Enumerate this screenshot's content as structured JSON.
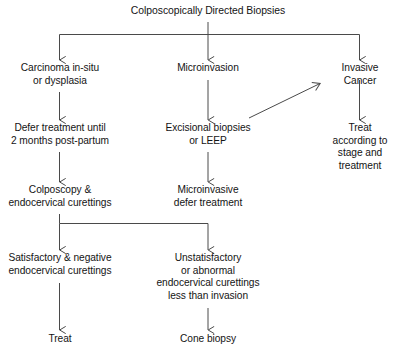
{
  "diagram": {
    "type": "flowchart",
    "title": "Colposcopically Directed Biopsies",
    "orientation": "top-down",
    "stroke_color": "#4a4a4a",
    "text_color": "#141414",
    "background_color": "#ffffff",
    "nodes": {
      "root": "Colposcopically Directed Biopsies",
      "branch_left_1": "Carcinoma in-situ\nor dysplasia",
      "branch_mid_1": "Microinvasion",
      "branch_right_1": "Invasive Cancer",
      "left_2": "Defer treatment until\n2 months post-partum",
      "mid_2": "Excisional biopsies\nor LEEP",
      "right_2": "Treat according to\nstage and treatment",
      "left_3": "Colposcopy &\nendocervical curettings",
      "mid_3": "Microinvasive\ndefer treatment",
      "left_4": "Satisfactory & negative\nendocervical curettings",
      "mid_4": "Unstatisfactory\nor abnormal\nendocervical curettings\nless than invasion",
      "left_5": "Treat",
      "mid_5": "Cone biopsy"
    },
    "edges": [
      {
        "from": "root",
        "to": "branch_left_1",
        "style": "elbow-arrow"
      },
      {
        "from": "root",
        "to": "branch_mid_1",
        "style": "straight-arrow"
      },
      {
        "from": "root",
        "to": "branch_right_1",
        "style": "elbow-arrow"
      },
      {
        "from": "branch_left_1",
        "to": "left_2",
        "style": "straight-arrow"
      },
      {
        "from": "branch_mid_1",
        "to": "mid_2",
        "style": "straight-arrow"
      },
      {
        "from": "branch_right_1",
        "to": "right_2",
        "style": "straight-arrow"
      },
      {
        "from": "mid_2",
        "to": "branch_right_1",
        "style": "diagonal-arrow"
      },
      {
        "from": "left_2",
        "to": "left_3",
        "style": "straight-arrow"
      },
      {
        "from": "mid_2",
        "to": "mid_3",
        "style": "straight-arrow"
      },
      {
        "from": "left_3",
        "to": "left_4",
        "style": "elbow-arrow"
      },
      {
        "from": "left_3",
        "to": "mid_4",
        "style": "elbow-arrow"
      },
      {
        "from": "left_4",
        "to": "left_5",
        "style": "straight-arrow"
      },
      {
        "from": "mid_4",
        "to": "mid_5",
        "style": "straight-arrow"
      }
    ]
  }
}
